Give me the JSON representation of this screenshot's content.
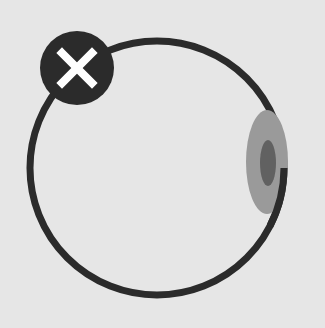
{
  "illustration": {
    "description": "Eye ball with close badge",
    "colors": {
      "background": "#e6e6e6",
      "outline": "#2b2b2b",
      "iris": "#9a9a9a",
      "pupil": "#616161",
      "badge": "#2b2b2b",
      "badge_mark": "#ffffff"
    }
  },
  "badge": {
    "icon": "close-icon"
  }
}
